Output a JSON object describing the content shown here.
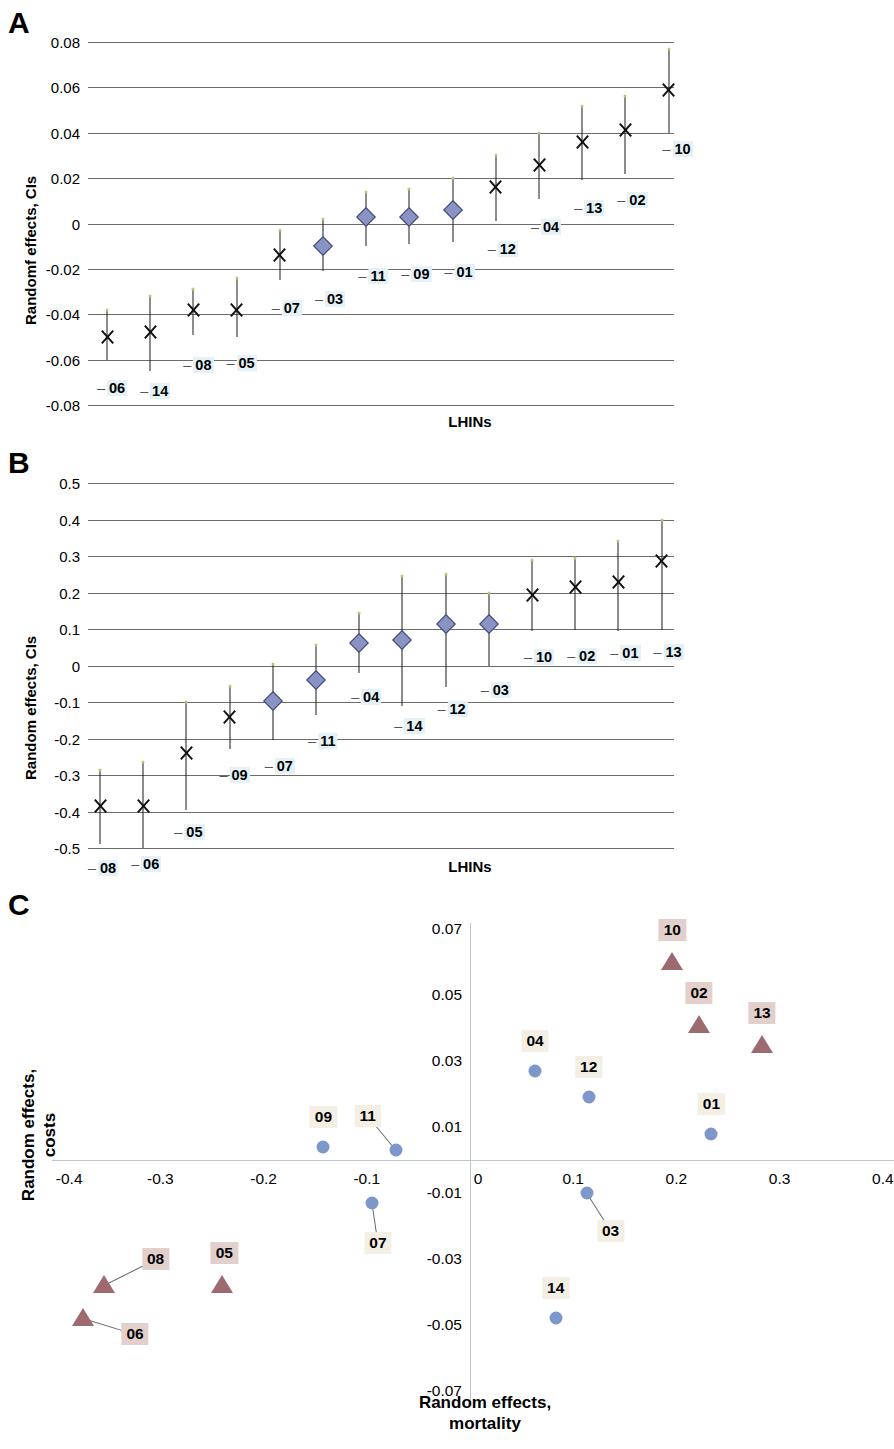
{
  "figure": {
    "panels": [
      "A",
      "B",
      "C"
    ]
  },
  "panelA": {
    "letter": "A",
    "ylabel": "Randomf effects, CIs",
    "xlabel": "LHINs",
    "yticks": [
      "0.08",
      "0.06",
      "0.04",
      "0.02",
      "0",
      "-0.02",
      "-0.04",
      "-0.06",
      "-0.08"
    ]
  },
  "panelB": {
    "letter": "B",
    "ylabel": "Random effects, CIs",
    "xlabel": "LHINs",
    "yticks": [
      "0.5",
      "0.4",
      "0.3",
      "0.2",
      "0.1",
      "0",
      "-0.1",
      "-0.2",
      "-0.3",
      "-0.4",
      "-0.5"
    ]
  },
  "panelC": {
    "letter": "C",
    "ylabel": "Random effects,\ncosts",
    "xlabel": "Random effects,\nmortality",
    "xticks": [
      "-0.4",
      "-0.3",
      "-0.2",
      "-0.1",
      "0",
      "0.1",
      "0.2",
      "0.3",
      "0.4"
    ],
    "yticks": [
      "0.07",
      "0.05",
      "0.03",
      "0.01",
      "0",
      "-0.01",
      "-0.03",
      "-0.05",
      "-0.07"
    ]
  },
  "chart_data": [
    {
      "type": "scatter",
      "id": "A",
      "title": "A",
      "xlabel": "LHINs",
      "ylabel": "Randomf effects, CIs",
      "ylim": [
        -0.08,
        0.08
      ],
      "grid": true,
      "legend": null,
      "marker_meaning": {
        "x": "not significant / crossing zero",
        "diamond": "diamond marker"
      },
      "categories": [
        "06",
        "14",
        "08",
        "05",
        "07",
        "03",
        "11",
        "09",
        "01",
        "12",
        "04",
        "13",
        "02",
        "10"
      ],
      "points": [
        {
          "label": "06",
          "estimate": -0.05,
          "low": -0.06,
          "high": -0.038,
          "marker": "x"
        },
        {
          "label": "14",
          "estimate": -0.048,
          "low": -0.065,
          "high": -0.032,
          "marker": "x"
        },
        {
          "label": "08",
          "estimate": -0.038,
          "low": -0.049,
          "high": -0.029,
          "marker": "x"
        },
        {
          "label": "05",
          "estimate": -0.038,
          "low": -0.05,
          "high": -0.024,
          "marker": "x"
        },
        {
          "label": "07",
          "estimate": -0.014,
          "low": -0.025,
          "high": -0.003,
          "marker": "x"
        },
        {
          "label": "03",
          "estimate": -0.01,
          "low": -0.021,
          "high": 0.002,
          "marker": "diamond"
        },
        {
          "label": "11",
          "estimate": 0.003,
          "low": -0.01,
          "high": 0.014,
          "marker": "diamond"
        },
        {
          "label": "09",
          "estimate": 0.003,
          "low": -0.009,
          "high": 0.015,
          "marker": "diamond"
        },
        {
          "label": "01",
          "estimate": 0.006,
          "low": -0.008,
          "high": 0.02,
          "marker": "diamond"
        },
        {
          "label": "12",
          "estimate": 0.016,
          "low": 0.001,
          "high": 0.03,
          "marker": "x"
        },
        {
          "label": "04",
          "estimate": 0.026,
          "low": 0.011,
          "high": 0.04,
          "marker": "x"
        },
        {
          "label": "13",
          "estimate": 0.036,
          "low": 0.019,
          "high": 0.052,
          "marker": "x"
        },
        {
          "label": "02",
          "estimate": 0.041,
          "low": 0.022,
          "high": 0.056,
          "marker": "x"
        },
        {
          "label": "10",
          "estimate": 0.059,
          "low": 0.04,
          "high": 0.077,
          "marker": "x"
        }
      ]
    },
    {
      "type": "scatter",
      "id": "B",
      "title": "B",
      "xlabel": "LHINs",
      "ylabel": "Random effects, CIs",
      "ylim": [
        -0.5,
        0.5
      ],
      "grid": true,
      "legend": null,
      "categories": [
        "08",
        "06",
        "05",
        "09",
        "07",
        "11",
        "04",
        "14",
        "12",
        "03",
        "10",
        "02",
        "01",
        "13"
      ],
      "points": [
        {
          "label": "08",
          "estimate": -0.385,
          "low": -0.49,
          "high": -0.285,
          "marker": "x"
        },
        {
          "label": "06",
          "estimate": -0.385,
          "low": -0.5,
          "high": -0.265,
          "marker": "x"
        },
        {
          "label": "05",
          "estimate": -0.24,
          "low": -0.395,
          "high": -0.1,
          "marker": "x"
        },
        {
          "label": "09",
          "estimate": -0.14,
          "low": -0.23,
          "high": -0.055,
          "marker": "x"
        },
        {
          "label": "07",
          "estimate": -0.097,
          "low": -0.203,
          "high": 0.005,
          "marker": "diamond"
        },
        {
          "label": "11",
          "estimate": -0.04,
          "low": -0.135,
          "high": 0.055,
          "marker": "diamond"
        },
        {
          "label": "04",
          "estimate": 0.062,
          "low": -0.02,
          "high": 0.145,
          "marker": "diamond"
        },
        {
          "label": "14",
          "estimate": 0.07,
          "low": -0.11,
          "high": 0.245,
          "marker": "diamond"
        },
        {
          "label": "12",
          "estimate": 0.113,
          "low": -0.06,
          "high": 0.25,
          "marker": "diamond"
        },
        {
          "label": "03",
          "estimate": 0.113,
          "low": -0.002,
          "high": 0.2,
          "marker": "diamond"
        },
        {
          "label": "10",
          "estimate": 0.193,
          "low": 0.095,
          "high": 0.288,
          "marker": "x"
        },
        {
          "label": "02",
          "estimate": 0.215,
          "low": 0.098,
          "high": 0.295,
          "marker": "x"
        },
        {
          "label": "01",
          "estimate": 0.228,
          "low": 0.095,
          "high": 0.34,
          "marker": "x"
        },
        {
          "label": "13",
          "estimate": 0.285,
          "low": 0.097,
          "high": 0.4,
          "marker": "x"
        }
      ]
    },
    {
      "type": "scatter",
      "id": "C",
      "title": "C",
      "xlabel": "Random effects, mortality",
      "ylabel": "Random effects, costs",
      "xlim": [
        -0.4,
        0.4
      ],
      "ylim": [
        -0.07,
        0.07
      ],
      "grid": false,
      "legend": null,
      "points": [
        {
          "label": "09",
          "x": -0.142,
          "y": 0.004,
          "marker": "circle",
          "color": "#7d97cb"
        },
        {
          "label": "11",
          "x": -0.072,
          "y": 0.003,
          "marker": "circle",
          "color": "#7d97cb"
        },
        {
          "label": "07",
          "x": -0.095,
          "y": -0.013,
          "marker": "circle",
          "color": "#7d97cb"
        },
        {
          "label": "08",
          "x": -0.355,
          "y": -0.038,
          "marker": "triangle",
          "color": "#9c6a6f"
        },
        {
          "label": "05",
          "x": -0.24,
          "y": -0.038,
          "marker": "triangle",
          "color": "#9c6a6f"
        },
        {
          "label": "06",
          "x": -0.375,
          "y": -0.048,
          "marker": "triangle",
          "color": "#9c6a6f"
        },
        {
          "label": "04",
          "x": 0.063,
          "y": 0.027,
          "marker": "circle",
          "color": "#7d97cb"
        },
        {
          "label": "12",
          "x": 0.115,
          "y": 0.019,
          "marker": "circle",
          "color": "#7d97cb"
        },
        {
          "label": "01",
          "x": 0.234,
          "y": 0.008,
          "marker": "circle",
          "color": "#7d97cb"
        },
        {
          "label": "03",
          "x": 0.113,
          "y": -0.01,
          "marker": "circle",
          "color": "#7d97cb"
        },
        {
          "label": "14",
          "x": 0.083,
          "y": -0.048,
          "marker": "circle",
          "color": "#7d97cb"
        },
        {
          "label": "10",
          "x": 0.196,
          "y": 0.06,
          "marker": "triangle",
          "color": "#9c6a6f"
        },
        {
          "label": "02",
          "x": 0.222,
          "y": 0.041,
          "marker": "triangle",
          "color": "#9c6a6f"
        },
        {
          "label": "13",
          "x": 0.283,
          "y": 0.035,
          "marker": "triangle",
          "color": "#9c6a6f"
        }
      ]
    }
  ],
  "colors": {
    "diamond_fill": "#8a93c4",
    "circle_fill": "#7d97cb",
    "triangle_fill": "#9c6a6f",
    "gridline": "#6b6b6b",
    "label_blue_bg": "#e4f1f7",
    "label_cream_bg": "#f4efe4",
    "label_rose_bg": "#e3d0cd"
  }
}
